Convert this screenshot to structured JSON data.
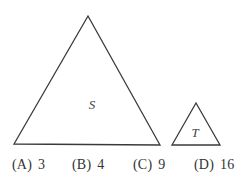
{
  "figure": {
    "shapes": [
      {
        "label": "S",
        "type": "triangle",
        "points": [
          [
            88,
            16
          ],
          [
            14,
            144
          ],
          [
            160,
            145
          ]
        ],
        "label_pos": [
          92,
          109
        ]
      },
      {
        "label": "T",
        "type": "triangle",
        "points": [
          [
            196,
            103
          ],
          [
            172,
            145
          ],
          [
            220,
            145
          ]
        ],
        "label_pos": [
          195,
          137
        ]
      }
    ],
    "stroke_color": "#3a3a3a"
  },
  "answer_choices": [
    {
      "letter": "(A)",
      "value": "3"
    },
    {
      "letter": "(B)",
      "value": "4"
    },
    {
      "letter": "(C)",
      "value": "9"
    },
    {
      "letter": "(D)",
      "value": "16"
    }
  ]
}
